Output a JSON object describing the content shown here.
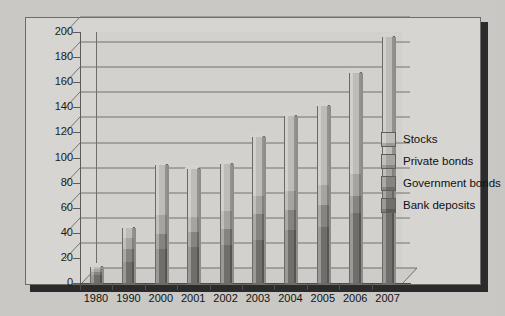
{
  "chart_data": {
    "type": "bar",
    "subtype": "stacked-column-3d",
    "title": "",
    "xlabel": "",
    "ylabel": "",
    "ylim": [
      0,
      200
    ],
    "ytick_step": 20,
    "yticks": [
      0,
      20,
      40,
      60,
      80,
      100,
      120,
      140,
      160,
      180,
      200
    ],
    "grid": true,
    "legend_position": "right",
    "categories": [
      "1980",
      "1990",
      "2000",
      "2001",
      "2002",
      "2003",
      "2004",
      "2005",
      "2006",
      "2007"
    ],
    "series": [
      {
        "name": "Bank deposits",
        "color": "#6f6e6a",
        "values": [
          6,
          17,
          27,
          29,
          30,
          34,
          42,
          45,
          56,
          62
        ]
      },
      {
        "name": "Government bonds",
        "color": "#85847f",
        "values": [
          3,
          10,
          12,
          12,
          13,
          21,
          16,
          17,
          13,
          18
        ]
      },
      {
        "name": "Private bonds",
        "color": "#a5a49f",
        "values": [
          2,
          9,
          15,
          12,
          14,
          14,
          15,
          16,
          18,
          20
        ]
      },
      {
        "name": "Stocks",
        "color": "#bdbcb7",
        "values": [
          2,
          8,
          40,
          38,
          38,
          47,
          60,
          63,
          80,
          96
        ]
      }
    ],
    "totals": [
      13,
      44,
      94,
      91,
      95,
      116,
      133,
      141,
      167,
      196
    ]
  },
  "legend": {
    "items": [
      {
        "label": "Stocks",
        "color": "#bdbcb7"
      },
      {
        "label": "Private bonds",
        "color": "#a5a49f"
      },
      {
        "label": "Government bonds",
        "color": "#85847f"
      },
      {
        "label": "Bank deposits",
        "color": "#6f6e6a"
      }
    ]
  },
  "theme": {
    "page_background": "#c9c8c4",
    "frame_background": "#d6d5d1",
    "plot_background": "#d2d1cd",
    "axis_color": "#5d5c59",
    "grid_color": "#74736f",
    "text_color": "#131313",
    "shadow_color": "#2b2b2b"
  }
}
